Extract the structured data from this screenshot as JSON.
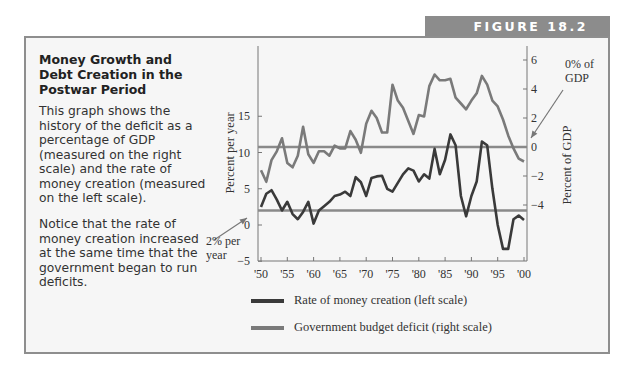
{
  "figure_label": "FIGURE 18.2",
  "sidebar": {
    "title": "Money Growth and Debt Creation in the Postwar Period",
    "paragraph1": "This graph shows the history of the deficit as a percentage of GDP (measured on the right scale) and the rate of money creation (measured on the left scale).",
    "paragraph2": "Notice that the rate of money creation increased at the same time that the government began to run deficits."
  },
  "annotations": {
    "left_ref": "2% per year",
    "right_ref": "0% of GDP"
  },
  "colors": {
    "money": "#3a3a3a",
    "deficit": "#7a7a7a",
    "reference": "#8a8a8a",
    "box_bg": "#f6f6f6",
    "tab_bg": "#8c8c8c"
  },
  "chart_data": {
    "type": "line",
    "title": "Money Growth and Debt Creation in the Postwar Period",
    "xlabel": "",
    "ylabel": "Percent per year",
    "ylabel_right": "Percent of GDP",
    "x": [
      1950,
      1951,
      1952,
      1953,
      1954,
      1955,
      1956,
      1957,
      1958,
      1959,
      1960,
      1961,
      1962,
      1963,
      1964,
      1965,
      1966,
      1967,
      1968,
      1969,
      1970,
      1971,
      1972,
      1973,
      1974,
      1975,
      1976,
      1977,
      1978,
      1979,
      1980,
      1981,
      1982,
      1983,
      1984,
      1985,
      1986,
      1987,
      1988,
      1989,
      1990,
      1991,
      1992,
      1993,
      1994,
      1995,
      1996,
      1997,
      1998,
      1999,
      2000
    ],
    "x_tick_labels": [
      "'50",
      "'55",
      "'60",
      "'65",
      "'70",
      "'75",
      "'80",
      "'85",
      "'90",
      "'95",
      "'00"
    ],
    "ylim": [
      -5,
      20
    ],
    "y_ticks": [
      -5,
      0,
      5,
      10,
      15
    ],
    "ylim_right": [
      -5,
      6.5
    ],
    "y_ticks_right": [
      -4,
      -2,
      0,
      2,
      4,
      6
    ],
    "reference_lines": [
      {
        "axis": "left",
        "value": 2,
        "label": "2% per year"
      },
      {
        "axis": "right",
        "value": 0,
        "label": "0% of GDP"
      }
    ],
    "series": [
      {
        "name": "Rate of money creation (left scale)",
        "axis": "left",
        "values": [
          2.5,
          4.3,
          4.8,
          3.5,
          2.0,
          3.2,
          1.5,
          0.8,
          1.8,
          3.2,
          0.2,
          2.0,
          2.6,
          3.2,
          4.0,
          4.2,
          4.6,
          4.0,
          6.6,
          5.9,
          4.0,
          6.5,
          6.7,
          6.8,
          5.0,
          4.6,
          5.8,
          7.0,
          7.8,
          7.5,
          6.0,
          7.0,
          6.4,
          10.5,
          7.0,
          9.0,
          12.5,
          11.0,
          4.0,
          1.2,
          4.0,
          6.0,
          11.5,
          11.0,
          5.0,
          0.0,
          -3.3,
          -3.3,
          0.8,
          1.3,
          0.7
        ]
      },
      {
        "name": "Government budget deficit (right scale)",
        "axis": "right",
        "values": [
          -1.6,
          -2.4,
          -0.9,
          -0.3,
          0.6,
          -1.1,
          -1.4,
          -0.6,
          1.4,
          -0.5,
          -1.1,
          -0.3,
          -0.3,
          -0.6,
          0.1,
          -0.1,
          -0.1,
          1.1,
          0.5,
          -0.4,
          1.6,
          2.5,
          2.0,
          1.0,
          1.0,
          4.3,
          3.2,
          2.7,
          1.8,
          0.9,
          2.2,
          2.1,
          4.2,
          5.0,
          4.6,
          4.6,
          4.7,
          3.4,
          3.0,
          2.6,
          3.2,
          3.7,
          4.9,
          4.3,
          3.2,
          2.8,
          1.9,
          0.8,
          -0.1,
          -0.8,
          -1.0
        ]
      }
    ],
    "legend": [
      "Rate of money creation (left scale)",
      "Government budget deficit (right scale)"
    ],
    "legend_position": "bottom",
    "grid": false
  }
}
